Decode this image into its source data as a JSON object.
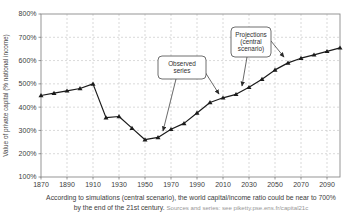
{
  "chart_data": {
    "type": "line",
    "title": "",
    "xlabel": "",
    "ylabel": "Value of private capital (% national income)",
    "x": [
      1870,
      1880,
      1890,
      1900,
      1910,
      1920,
      1930,
      1940,
      1950,
      1960,
      1970,
      1980,
      1990,
      2000,
      2010,
      2020,
      2030,
      2040,
      2050,
      2060,
      2070,
      2080,
      2090,
      2100
    ],
    "values": [
      450,
      460,
      470,
      480,
      500,
      355,
      360,
      310,
      260,
      270,
      305,
      330,
      375,
      420,
      440,
      455,
      485,
      520,
      560,
      590,
      610,
      625,
      640,
      655
    ],
    "xlim": [
      1870,
      2100
    ],
    "ylim": [
      100,
      800
    ],
    "x_ticks": [
      1870,
      1890,
      1910,
      1930,
      1950,
      1970,
      1990,
      2010,
      2030,
      2050,
      2070,
      2090
    ],
    "y_ticks": [
      100,
      200,
      300,
      400,
      500,
      600,
      700,
      800
    ],
    "y_tick_labels": [
      "100%",
      "200%",
      "300%",
      "400%",
      "500%",
      "600%",
      "700%",
      "800%"
    ],
    "grid": true,
    "legend": "none",
    "line_color": "#1b1b1b",
    "grid_color": "#c9c9c9",
    "border_color": "#8a8a8a",
    "text_color": "#3c3c3c",
    "annotations": [
      {
        "name": "observed-series",
        "lines": [
          "Observed",
          "series"
        ]
      },
      {
        "name": "projections-central-scenario",
        "lines": [
          "Projections",
          "(central",
          "scenario)"
        ]
      }
    ]
  },
  "caption": {
    "line1": "According to simulations (central scenario), the world capital/income ratio could be near to 700%",
    "line2": "by the end of the 21st century.",
    "source": "Sources and series: see piketty.pse.ens.fr/capital21c"
  }
}
